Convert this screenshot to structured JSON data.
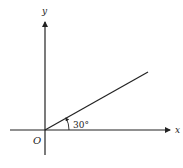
{
  "diagram": {
    "x_axis_label": "x",
    "y_axis_label": "y",
    "origin_label": "O",
    "angle_label": "30°",
    "angle_degrees": 30,
    "line_color": "#222222"
  }
}
